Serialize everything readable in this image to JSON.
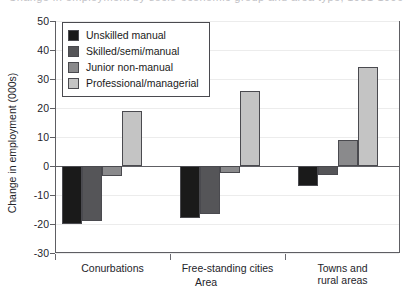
{
  "title_sliver": "Change in employment by socio-economic group and area type, 1981-1996",
  "chart_data": {
    "type": "bar",
    "title": "",
    "xlabel": "Area",
    "ylabel": "Change in employment (000s)",
    "ylim": [
      -30,
      50
    ],
    "ytick_step": 10,
    "yticks": [
      "50",
      "40",
      "30",
      "20",
      "10",
      "0",
      "-10",
      "-20",
      "-30"
    ],
    "grid": true,
    "grid_axis": "y",
    "legend_position": "inside-top-left",
    "categories": [
      "Conurbations",
      "Free-standing cities",
      "Towns and rural areas"
    ],
    "series": [
      {
        "name": "Unskilled manual",
        "color": "#1a1a1a",
        "values": [
          -20,
          -18,
          -7
        ]
      },
      {
        "name": "Skilled/semi/manual",
        "color": "#555558",
        "values": [
          -19,
          -16.5,
          -3
        ]
      },
      {
        "name": "Junior non-manual",
        "color": "#8a8a8c",
        "values": [
          -3.5,
          -2.5,
          9
        ]
      },
      {
        "name": "Professional/managerial",
        "color": "#c4c4c4",
        "values": [
          19,
          26,
          34
        ]
      }
    ]
  },
  "legend": {
    "items": [
      {
        "label": "Unskilled manual"
      },
      {
        "label": "Skilled/semi/manual"
      },
      {
        "label": "Junior non-manual"
      },
      {
        "label": "Professional/managerial"
      }
    ]
  },
  "axis": {
    "y_title": "Change in employment (000s)",
    "x_title": "Area",
    "x_categories": [
      {
        "line1": "Conurbations",
        "line2": ""
      },
      {
        "line1": "Free-standing cities",
        "line2": ""
      },
      {
        "line1": "Towns and",
        "line2": "rural areas"
      }
    ]
  }
}
